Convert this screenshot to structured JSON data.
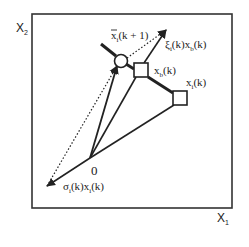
{
  "diagram": {
    "axes": {
      "x_label": "X",
      "x_sub": "1",
      "y_label": "X",
      "y_sub": "2"
    },
    "origin_label": "0",
    "points": {
      "x_bar_i_next": {
        "main": "x",
        "sub": "i",
        "arg": "(k + 1)"
      },
      "x_b": {
        "main": "x",
        "sub": "b",
        "arg": "(k)"
      },
      "x_i": {
        "main": "x",
        "sub": "i",
        "arg": "(k)"
      }
    },
    "labels": {
      "xi_term": {
        "greek": "ξ",
        "sub": "i",
        "mid": "(k)x",
        "sub2": "b",
        "arg": "(k)"
      },
      "sigma_term": {
        "greek": "σ",
        "sub": "i",
        "mid": "(k)x",
        "sub2": "i",
        "arg": "(k)"
      }
    },
    "colors": {
      "stroke": "#222222",
      "background": "#ffffff"
    }
  }
}
